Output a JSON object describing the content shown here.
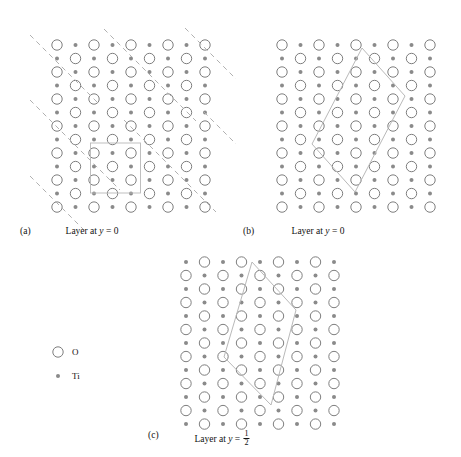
{
  "figure": {
    "background": "#ffffff",
    "o_stroke": "#6f6f6f",
    "ti_fill": "#8a8a8a",
    "cell_stroke": "#b9b9b9",
    "dash_stroke": "#b0b0b0",
    "o_radius": 5.2,
    "ti_radius": 2.0
  },
  "legend": {
    "items": [
      {
        "symbol": "o-circle",
        "label": "O"
      },
      {
        "symbol": "ti-dot",
        "label": "Ti"
      }
    ]
  },
  "panels": [
    {
      "id": "a",
      "letter": "(a)",
      "caption_prefix": "Layer at ",
      "caption_var": "y",
      "caption_eq": " = 0",
      "caption_value": "0",
      "caption_fraction": null,
      "cell_type": "square",
      "has_dashed_traces": true,
      "origin": {
        "x": 57,
        "y": 45
      },
      "step": 18.5,
      "cols": 9,
      "rows": 7,
      "parity": 0,
      "unit_cell": {
        "x": 90.5,
        "y": 143,
        "w": 50,
        "h": 50
      },
      "dashed_lines": [
        {
          "x1": 30,
          "y1": 35,
          "x2": 98,
          "y2": 103
        },
        {
          "x1": 30,
          "y1": 100,
          "x2": 120,
          "y2": 190
        },
        {
          "x1": 30,
          "y1": 176,
          "x2": 86,
          "y2": 232
        },
        {
          "x1": 104,
          "y1": 29,
          "x2": 196,
          "y2": 121
        },
        {
          "x1": 124,
          "y1": 120,
          "x2": 216,
          "y2": 212
        },
        {
          "x1": 185,
          "y1": 28,
          "x2": 236,
          "y2": 79
        },
        {
          "x1": 204,
          "y1": 112,
          "x2": 236,
          "y2": 144
        }
      ]
    },
    {
      "id": "b",
      "letter": "(b)",
      "caption_prefix": "Layer at ",
      "caption_var": "y",
      "caption_eq": " = 0",
      "caption_value": "0",
      "caption_fraction": null,
      "cell_type": "rhombus",
      "has_dashed_traces": false,
      "origin": {
        "x": 282,
        "y": 45
      },
      "step": 18.5,
      "cols": 9,
      "rows": 7,
      "parity": 0,
      "rhombus": [
        {
          "x": 362,
          "y": 48
        },
        {
          "x": 405,
          "y": 96
        },
        {
          "x": 355,
          "y": 192
        },
        {
          "x": 312,
          "y": 144
        }
      ]
    },
    {
      "id": "c",
      "letter": "(c)",
      "caption_prefix": "Layer at ",
      "caption_var": "y",
      "caption_eq": " = ",
      "caption_value": "1/2",
      "caption_fraction": {
        "num": "1",
        "den": "2"
      },
      "cell_type": "rhombus",
      "has_dashed_traces": false,
      "origin": {
        "x": 186,
        "y": 262
      },
      "step": 18.5,
      "cols": 9,
      "rows": 7,
      "parity": 1,
      "rhombus": [
        {
          "x": 252,
          "y": 262
        },
        {
          "x": 296,
          "y": 310
        },
        {
          "x": 271,
          "y": 405
        },
        {
          "x": 224,
          "y": 357
        }
      ]
    }
  ],
  "captions": {
    "a": {
      "letter_pos": {
        "x": 20,
        "y": 226
      },
      "text_pos": {
        "x": 92,
        "y": 226
      }
    },
    "b": {
      "letter_pos": {
        "x": 243,
        "y": 226
      },
      "text_pos": {
        "x": 318,
        "y": 226
      }
    },
    "c": {
      "letter_pos": {
        "x": 148,
        "y": 430
      },
      "text_pos": {
        "x": 222,
        "y": 430
      }
    }
  },
  "legend_pos": {
    "circle": {
      "x": 58,
      "y": 352
    },
    "circle_label": {
      "x": 72,
      "y": 356
    },
    "dot": {
      "x": 58,
      "y": 376
    },
    "dot_label": {
      "x": 72,
      "y": 380
    }
  }
}
